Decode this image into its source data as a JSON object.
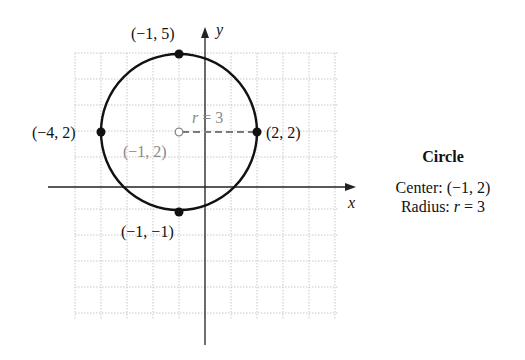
{
  "chart_data": {
    "type": "diagram",
    "title": "Circle",
    "xlabel": "x",
    "ylabel": "y",
    "xlim": [
      -5,
      5
    ],
    "ylim": [
      -5,
      5
    ],
    "grid": true,
    "circle": {
      "center": [
        -1,
        2
      ],
      "radius": 3
    },
    "points": [
      {
        "label": "(−1, 5)",
        "x": -1,
        "y": 5,
        "style": "filled"
      },
      {
        "label": "(−4, 2)",
        "x": -4,
        "y": 2,
        "style": "filled"
      },
      {
        "label": "(2, 2)",
        "x": 2,
        "y": 2,
        "style": "filled"
      },
      {
        "label": "(−1, −1)",
        "x": -1,
        "y": -1,
        "style": "filled"
      },
      {
        "label": "(−1, 2)",
        "x": -1,
        "y": 2,
        "style": "open"
      }
    ],
    "radius_segment": {
      "from": [
        -1,
        2
      ],
      "to": [
        2,
        2
      ],
      "label": "r = 3",
      "style": "dashed"
    }
  },
  "labels": {
    "top": "(−1, 5)",
    "left": "(−4, 2)",
    "right": "(2, 2)",
    "bottom": "(−1, −1)",
    "center": "(−1, 2)",
    "radius_r": "r",
    "radius_eq": "= 3",
    "axis_x": "x",
    "axis_y": "y"
  },
  "info": {
    "title": "Circle",
    "center_prefix": "Center: ",
    "center_value": "(−1, 2)",
    "radius_prefix": "Radius: ",
    "radius_var": "r",
    "radius_value": " = 3"
  }
}
